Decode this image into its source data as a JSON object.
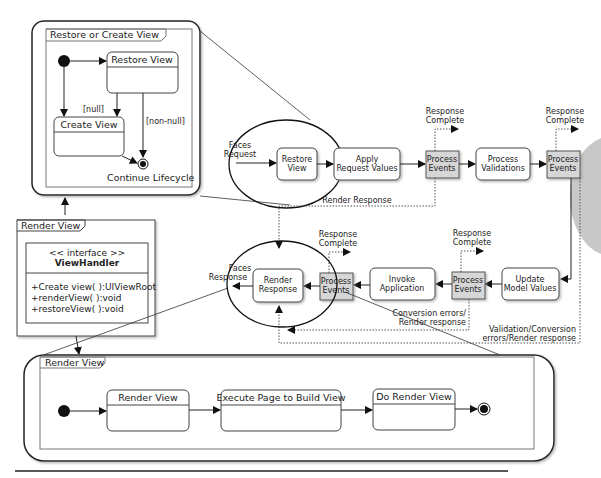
{
  "restore_or_create": {
    "frame_title": "Restore or Create View",
    "states": {
      "restore_view": "Restore View",
      "create_view": "Create View"
    },
    "guards": {
      "null": "[null]",
      "non_null": "[non-null]"
    },
    "final_label": "Continue Lifecycle"
  },
  "render_view_class": {
    "frame_title": "Render View",
    "stereotype": "<< interface >>",
    "class_name": "ViewHandler",
    "methods": [
      "+Create view( ):UIViewRoot",
      "+renderView( ):void",
      "+restoreView( ):void"
    ]
  },
  "lifecycle": {
    "faces_request": [
      "Faces",
      "Request"
    ],
    "faces_response": [
      "Faces",
      "Response"
    ],
    "phases": {
      "restore_view": [
        "Restore",
        "View"
      ],
      "apply_request_values": [
        "Apply",
        "Request Values"
      ],
      "process_validations": [
        "Process",
        "Validations"
      ],
      "update_model_values": [
        "Update",
        "Model Values"
      ],
      "invoke_application": [
        "Invoke",
        "Application"
      ],
      "render_response": [
        "Render",
        "Response"
      ]
    },
    "process_events": [
      "Process",
      "Events"
    ],
    "response_complete": [
      "Response",
      "Complete"
    ],
    "render_response_label": "Render Response",
    "conversion_errors": [
      "Conversion errors/",
      "Render response"
    ],
    "validation_errors": [
      "Validation/Conversion",
      "errors/Render response"
    ]
  },
  "render_view_flow": {
    "frame_title": "Render View",
    "states": [
      "Render View",
      "Execute Page to Build View",
      "Do Render View"
    ]
  },
  "colors": {
    "line": "#222222",
    "process_events_fill": "#d6d6d6",
    "frame_border": "#555555",
    "side_tab": "#c8c8c8"
  }
}
